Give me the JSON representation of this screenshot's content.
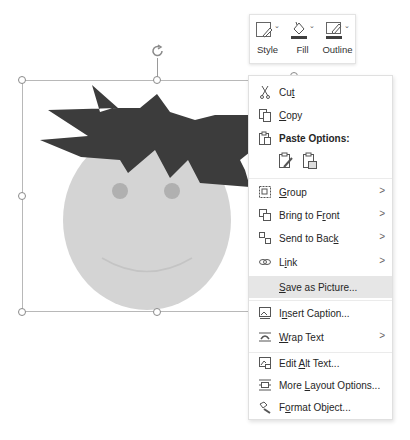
{
  "mini_toolbar": {
    "buttons": [
      {
        "label": "Style",
        "icon": "shape-style-icon"
      },
      {
        "label": "Fill",
        "icon": "paint-bucket-icon"
      },
      {
        "label": "Outline",
        "icon": "pencil-outline-icon"
      }
    ],
    "fill_color": "#3f3f3f",
    "outline_color": "#3f3f3f"
  },
  "shape": {
    "hair_color": "#3c3c3c",
    "face_color": "#d4d4d4",
    "cheek_color": "#b0b0b0",
    "mouth_color": "#c4c4c4"
  },
  "context_menu": {
    "items": [
      {
        "pre": "Cu",
        "u": "t",
        "post": "",
        "icon": "scissors-icon",
        "submenu": false
      },
      {
        "pre": "",
        "u": "C",
        "post": "opy",
        "icon": "copy-icon",
        "submenu": false
      },
      {
        "pre": "Paste Options:",
        "u": "",
        "post": "",
        "icon": "paste-icon",
        "submenu": false,
        "bold": true
      },
      {
        "pre": "",
        "u": "G",
        "post": "roup",
        "icon": "group-icon",
        "submenu": true
      },
      {
        "pre": "Bring to F",
        "u": "r",
        "post": "ont",
        "icon": "bring-to-front-icon",
        "submenu": true
      },
      {
        "pre": "Send to Bac",
        "u": "k",
        "post": "",
        "icon": "send-to-back-icon",
        "submenu": true
      },
      {
        "pre": "L",
        "u": "i",
        "post": "nk",
        "icon": "link-icon",
        "submenu": true
      },
      {
        "pre": "",
        "u": "S",
        "post": "ave as Picture...",
        "icon": "",
        "submenu": false,
        "highlighted": true
      },
      {
        "pre": "I",
        "u": "n",
        "post": "sert Caption...",
        "icon": "insert-caption-icon",
        "submenu": false
      },
      {
        "pre": "",
        "u": "W",
        "post": "rap Text",
        "icon": "wrap-text-icon",
        "submenu": true
      },
      {
        "pre": "Edit ",
        "u": "A",
        "post": "lt Text...",
        "icon": "alt-text-icon",
        "submenu": false
      },
      {
        "pre": "More ",
        "u": "L",
        "post": "ayout Options...",
        "icon": "layout-options-icon",
        "submenu": false
      },
      {
        "pre": "F",
        "u": "o",
        "post": "rmat Object...",
        "icon": "format-object-icon",
        "submenu": false
      }
    ],
    "paste_options": [
      {
        "icon": "paste-keep-source-formatting-icon"
      },
      {
        "icon": "paste-as-picture-icon"
      }
    ],
    "submenu_arrow": ">"
  }
}
